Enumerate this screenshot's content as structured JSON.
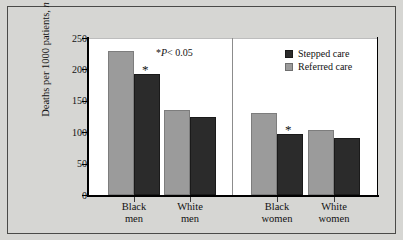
{
  "chart_data": {
    "type": "bar",
    "title": "",
    "xlabel": "",
    "ylabel": "Deaths per 1000 patients, n",
    "ylabel_italic_part": "n",
    "ylim": [
      0,
      250
    ],
    "yticks": [
      0,
      50,
      100,
      150,
      200,
      250
    ],
    "grid": false,
    "legend_position": "top-right",
    "categories": [
      "Black men",
      "White men",
      "Black women",
      "White women"
    ],
    "category_lines": [
      [
        "Black",
        "men"
      ],
      [
        "White",
        "men"
      ],
      [
        "Black",
        "women"
      ],
      [
        "White",
        "women"
      ]
    ],
    "series": [
      {
        "name": "Referred care",
        "color": "#9b9b9b",
        "values": [
          229,
          136,
          131,
          103
        ]
      },
      {
        "name": "Stepped care",
        "color": "#2b2b2b",
        "values": [
          192,
          125,
          98,
          91
        ]
      }
    ],
    "annotations": [
      {
        "name": "p-value-note",
        "text": "*P< 0.05",
        "prefix": "*",
        "italic": "P",
        "suffix": "< 0.05"
      },
      {
        "name": "significance-star-black-men",
        "text": "*",
        "applies_to": "Black men / Stepped care"
      },
      {
        "name": "significance-star-black-women",
        "text": "*",
        "applies_to": "Black women / Stepped care"
      }
    ],
    "group_divider": true,
    "group_divider_after_category": "White men"
  },
  "legend": {
    "items": [
      {
        "label": "Stepped care",
        "color": "#2b2b2b"
      },
      {
        "label": "Referred care",
        "color": "#9b9b9b"
      }
    ]
  },
  "axis": {
    "y_title_main": "Deaths per 1000 patients, ",
    "y_title_italic": "n",
    "tick_labels": [
      "250",
      "200",
      "150",
      "100",
      "50",
      "0"
    ]
  },
  "colors": {
    "background": "#d6d6d3",
    "plot_background": "#ffffff",
    "stepped_care": "#2b2b2b",
    "referred_care": "#9b9b9b",
    "axis": "#000000",
    "divider": "#8c8c8c"
  }
}
